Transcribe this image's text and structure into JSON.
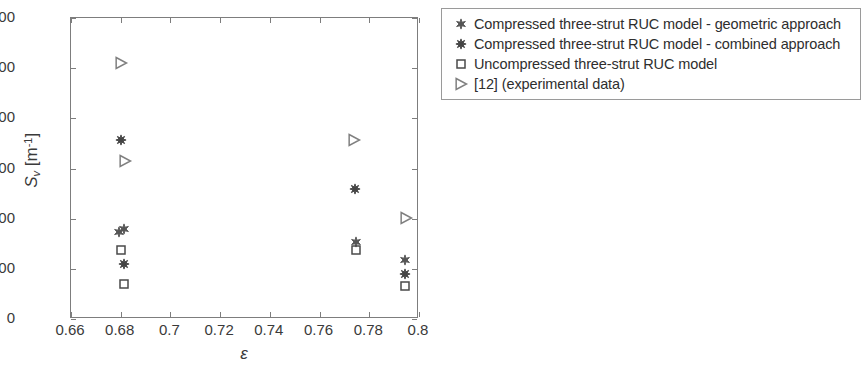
{
  "chart_data": {
    "type": "scatter",
    "title": "",
    "subtitle": "",
    "xlabel": "ε",
    "ylabel": "S_v [m^-1]",
    "ylabel_base": "S",
    "ylabel_sub": "v",
    "ylabel_unit_open": " [m",
    "ylabel_sup": "-1",
    "ylabel_unit_close": "]",
    "xlim": [
      0.66,
      0.8
    ],
    "ylim": [
      0,
      6000
    ],
    "xticks": [
      0.66,
      0.68,
      0.7,
      0.72,
      0.74,
      0.76,
      0.78,
      0.8
    ],
    "xtick_labels": [
      "0.66",
      "0.68",
      "0.7",
      "0.72",
      "0.74",
      "0.76",
      "0.78",
      "0.8"
    ],
    "yticks": [
      0,
      1000,
      2000,
      3000,
      4000,
      5000,
      6000
    ],
    "ytick_labels": [
      "0",
      "1000",
      "2000",
      "3000",
      "4000",
      "5000",
      "6000"
    ],
    "grid": false,
    "legend_position": "outside-right-top",
    "series": [
      {
        "name": "Compressed three-strut RUC model - geometric approach",
        "marker": "six-pointed-star",
        "marker_size": 9,
        "color": "#555555",
        "points": [
          {
            "x": 0.6792,
            "y": 1740
          },
          {
            "x": 0.6812,
            "y": 1790
          },
          {
            "x": 0.7748,
            "y": 1530
          },
          {
            "x": 0.7942,
            "y": 1180
          }
        ]
      },
      {
        "name": "Compressed three-strut RUC model - combined approach",
        "marker": "eight-pointed-star",
        "marker_size": 9,
        "color": "#444444",
        "points": [
          {
            "x": 0.68,
            "y": 3570
          },
          {
            "x": 0.6812,
            "y": 1100
          },
          {
            "x": 0.7744,
            "y": 2590
          },
          {
            "x": 0.7942,
            "y": 900
          }
        ]
      },
      {
        "name": "Uncompressed three-strut RUC model",
        "marker": "open-square",
        "marker_size": 8,
        "color": "#4a4a4a",
        "points": [
          {
            "x": 0.68,
            "y": 1380
          },
          {
            "x": 0.6812,
            "y": 690
          },
          {
            "x": 0.7748,
            "y": 1380
          },
          {
            "x": 0.7942,
            "y": 650
          }
        ]
      },
      {
        "name": "[12] (experimental data)",
        "marker": "open-right-triangle",
        "marker_size": 11,
        "color": "#808080",
        "points": [
          {
            "x": 0.68,
            "y": 5100
          },
          {
            "x": 0.6816,
            "y": 3150
          },
          {
            "x": 0.774,
            "y": 3570
          },
          {
            "x": 0.7948,
            "y": 2020
          }
        ]
      }
    ]
  },
  "legend": {
    "items": [
      {
        "marker": "six-pointed-star",
        "label": "Compressed three-strut RUC model - geometric approach"
      },
      {
        "marker": "eight-pointed-star",
        "label": "Compressed three-strut RUC model - combined approach"
      },
      {
        "marker": "open-square",
        "label": "Uncompressed three-strut RUC model"
      },
      {
        "marker": "open-right-triangle",
        "label": "[12] (experimental data)"
      }
    ]
  },
  "colors": {
    "axis": "#7d7d7d",
    "text": "#3a3a3a",
    "legend_border": "#9a9a9a",
    "background": "#ffffff"
  }
}
